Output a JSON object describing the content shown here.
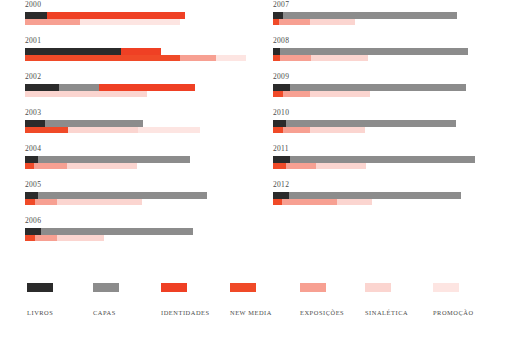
{
  "legend": {
    "items": [
      {
        "label": "LIVROS",
        "key": "livros",
        "color": "#2b2b2b",
        "x": 27
      },
      {
        "label": "CAPAS",
        "key": "capas",
        "color": "#8c8c8c",
        "x": 93
      },
      {
        "label": "IDENTIDADES",
        "key": "identidades",
        "color": "#ef4024",
        "x": 161
      },
      {
        "label": "NEW MEDIA",
        "key": "new_media",
        "color": "#f04a28",
        "x": 230
      },
      {
        "label": "EXPOSICOES",
        "key": "exposicoes",
        "color": "#f7a092",
        "x": 300
      },
      {
        "label": "SINALETICA",
        "key": "sinaletica",
        "color": "#fbd5d0",
        "x": 365
      },
      {
        "label": "PROMOCAO",
        "key": "promocao",
        "color": "#fde5e2",
        "x": 433
      }
    ],
    "labels_display": [
      "LIVROS",
      "CAPAS",
      "IDENTIDADES",
      "NEW MEDIA",
      "EXPOSIÇÕES",
      "SINALÉTICA",
      "PROMOÇÃO"
    ]
  },
  "chart_data": {
    "type": "bar",
    "title": "",
    "xlabel": "",
    "ylabel": "",
    "orientation": "horizontal",
    "stacked": true,
    "grid": false,
    "legend_position": "bottom",
    "categories": [
      "2000",
      "2001",
      "2002",
      "2003",
      "2004",
      "2005",
      "2006",
      "2007",
      "2008",
      "2009",
      "2010",
      "2011",
      "2012"
    ],
    "series": [
      {
        "name": "LIVROS",
        "color": "#2b2b2b",
        "row": "upper",
        "values": [
          22,
          96,
          34,
          20,
          13,
          13,
          16,
          10,
          7,
          17,
          13,
          17,
          16
        ]
      },
      {
        "name": "CAPAS",
        "color": "#8c8c8c",
        "row": "upper",
        "values": [
          0,
          0,
          40,
          98,
          152,
          169,
          152,
          174,
          188,
          176,
          170,
          185,
          172
        ]
      },
      {
        "name": "IDENTIDADES",
        "color": "#ef4024",
        "row": "upper",
        "values": [
          138,
          40,
          96,
          0,
          0,
          0,
          0,
          0,
          0,
          0,
          0,
          0,
          0
        ]
      },
      {
        "name": "NEW MEDIA",
        "color": "#f04a28",
        "row": "lower",
        "values": [
          0,
          155,
          0,
          43,
          9,
          10,
          10,
          6,
          7,
          10,
          10,
          13,
          9
        ]
      },
      {
        "name": "EXPOSICOES",
        "color": "#f7a092",
        "row": "lower",
        "values": [
          55,
          36,
          0,
          0,
          33,
          22,
          22,
          31,
          31,
          27,
          27,
          30,
          55
        ]
      },
      {
        "name": "SINALETICA",
        "color": "#fbd5d0",
        "row": "lower",
        "values": [
          0,
          0,
          122,
          70,
          70,
          85,
          47,
          45,
          57,
          60,
          55,
          50,
          35
        ]
      },
      {
        "name": "PROMOCAO",
        "color": "#fde5e2",
        "row": "lower",
        "values": [
          100,
          30,
          0,
          62,
          0,
          0,
          0,
          0,
          0,
          0,
          0,
          0,
          0
        ]
      }
    ],
    "axis_note": "values are bar pixel lengths at the rendered scale"
  },
  "years": [
    {
      "label": "2000",
      "upper": [
        {
          "k": "livros",
          "w": 22
        },
        {
          "k": "identidades",
          "w": 138
        }
      ],
      "lower": [
        {
          "k": "exposicoes",
          "w": 55
        },
        {
          "k": "promocao",
          "w": 100
        }
      ]
    },
    {
      "label": "2001",
      "upper": [
        {
          "k": "livros",
          "w": 96
        },
        {
          "k": "identidades",
          "w": 40
        }
      ],
      "lower": [
        {
          "k": "new_media",
          "w": 155
        },
        {
          "k": "exposicoes",
          "w": 36
        },
        {
          "k": "promocao",
          "w": 30
        }
      ]
    },
    {
      "label": "2002",
      "upper": [
        {
          "k": "livros",
          "w": 34
        },
        {
          "k": "capas",
          "w": 40
        },
        {
          "k": "identidades",
          "w": 96
        }
      ],
      "lower": [
        {
          "k": "sinaletica",
          "w": 122
        }
      ]
    },
    {
      "label": "2003",
      "upper": [
        {
          "k": "livros",
          "w": 20
        },
        {
          "k": "capas",
          "w": 98
        }
      ],
      "lower": [
        {
          "k": "new_media",
          "w": 43
        },
        {
          "k": "sinaletica",
          "w": 70
        },
        {
          "k": "promocao",
          "w": 62
        }
      ]
    },
    {
      "label": "2004",
      "upper": [
        {
          "k": "livros",
          "w": 13
        },
        {
          "k": "capas",
          "w": 152
        }
      ],
      "lower": [
        {
          "k": "new_media",
          "w": 9
        },
        {
          "k": "exposicoes",
          "w": 33
        },
        {
          "k": "sinaletica",
          "w": 70
        }
      ]
    },
    {
      "label": "2005",
      "upper": [
        {
          "k": "livros",
          "w": 13
        },
        {
          "k": "capas",
          "w": 169
        }
      ],
      "lower": [
        {
          "k": "new_media",
          "w": 10
        },
        {
          "k": "exposicoes",
          "w": 22
        },
        {
          "k": "sinaletica",
          "w": 85
        }
      ]
    },
    {
      "label": "2006",
      "upper": [
        {
          "k": "livros",
          "w": 16
        },
        {
          "k": "capas",
          "w": 152
        }
      ],
      "lower": [
        {
          "k": "new_media",
          "w": 10
        },
        {
          "k": "exposicoes",
          "w": 22
        },
        {
          "k": "sinaletica",
          "w": 47
        }
      ]
    },
    {
      "label": "2007",
      "upper": [
        {
          "k": "livros",
          "w": 10
        },
        {
          "k": "capas",
          "w": 174
        }
      ],
      "lower": [
        {
          "k": "new_media",
          "w": 6
        },
        {
          "k": "exposicoes",
          "w": 31
        },
        {
          "k": "sinaletica",
          "w": 45
        }
      ]
    },
    {
      "label": "2008",
      "upper": [
        {
          "k": "livros",
          "w": 7
        },
        {
          "k": "capas",
          "w": 188
        }
      ],
      "lower": [
        {
          "k": "new_media",
          "w": 7
        },
        {
          "k": "exposicoes",
          "w": 31
        },
        {
          "k": "sinaletica",
          "w": 57
        }
      ]
    },
    {
      "label": "2009",
      "upper": [
        {
          "k": "livros",
          "w": 17
        },
        {
          "k": "capas",
          "w": 176
        }
      ],
      "lower": [
        {
          "k": "new_media",
          "w": 10
        },
        {
          "k": "exposicoes",
          "w": 27
        },
        {
          "k": "sinaletica",
          "w": 60
        }
      ]
    },
    {
      "label": "2010",
      "upper": [
        {
          "k": "livros",
          "w": 13
        },
        {
          "k": "capas",
          "w": 170
        }
      ],
      "lower": [
        {
          "k": "new_media",
          "w": 10
        },
        {
          "k": "exposicoes",
          "w": 27
        },
        {
          "k": "sinaletica",
          "w": 55
        }
      ]
    },
    {
      "label": "2011",
      "upper": [
        {
          "k": "livros",
          "w": 17
        },
        {
          "k": "capas",
          "w": 185
        }
      ],
      "lower": [
        {
          "k": "new_media",
          "w": 13
        },
        {
          "k": "exposicoes",
          "w": 30
        },
        {
          "k": "sinaletica",
          "w": 50
        }
      ]
    },
    {
      "label": "2012",
      "upper": [
        {
          "k": "livros",
          "w": 16
        },
        {
          "k": "capas",
          "w": 172
        }
      ],
      "lower": [
        {
          "k": "new_media",
          "w": 9
        },
        {
          "k": "exposicoes",
          "w": 55
        },
        {
          "k": "sinaletica",
          "w": 35
        }
      ]
    }
  ]
}
